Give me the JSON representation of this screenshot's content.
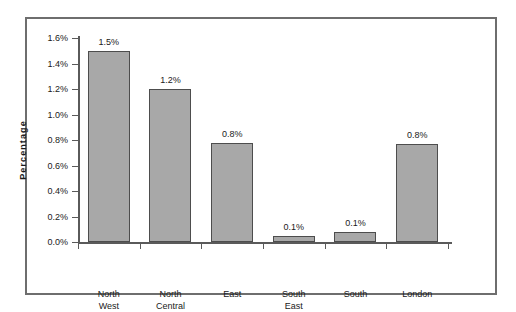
{
  "chart_data": {
    "type": "bar",
    "title": "",
    "subtitle": "",
    "xlabel": "",
    "ylabel": "Percentage",
    "ylim": [
      0,
      1.6
    ],
    "ytick_step": 0.2,
    "ytick_labels": [
      "0.0%",
      "0.2%",
      "0.4%",
      "0.6%",
      "0.8%",
      "1.0%",
      "1.2%",
      "1.4%",
      "1.6%"
    ],
    "ytick_values": [
      0.0,
      0.2,
      0.4,
      0.6,
      0.8,
      1.0,
      1.2,
      1.4,
      1.6
    ],
    "grid": false,
    "legend": null,
    "categories": [
      "North West",
      "North Central",
      "East",
      "South East",
      "South",
      "London"
    ],
    "category_lines": [
      [
        "North",
        "West"
      ],
      [
        "North",
        "Central"
      ],
      [
        "East"
      ],
      [
        "South",
        "East"
      ],
      [
        "South"
      ],
      [
        "London"
      ]
    ],
    "values": [
      1.5,
      1.2,
      0.78,
      0.05,
      0.08,
      0.77
    ],
    "data_labels": [
      "1.5%",
      "1.2%",
      "0.8%",
      "0.1%",
      "0.1%",
      "0.8%"
    ],
    "series": [
      {
        "name": "Percentage",
        "values": [
          1.5,
          1.2,
          0.78,
          0.05,
          0.08,
          0.77
        ]
      }
    ]
  },
  "style": {
    "bar_fill": "#a8a8a8",
    "bar_border": "#4d4d4d",
    "axis_color": "#5a5a5a",
    "frame_color": "#6e6e6e",
    "text_color": "#1a1a1a",
    "background": "#ffffff"
  }
}
